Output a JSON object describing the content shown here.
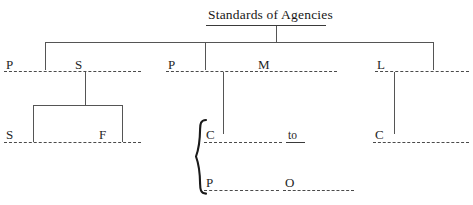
{
  "diagram": {
    "title": "Standards of Agencies",
    "type": "fill-in-the-blank organizational tree",
    "level2": [
      {
        "id": "p1",
        "label": "P"
      },
      {
        "id": "s1",
        "label": "S"
      },
      {
        "id": "p2",
        "label": "P"
      },
      {
        "id": "m1",
        "label": "M"
      },
      {
        "id": "l1",
        "label": "L"
      }
    ],
    "level3_left": [
      {
        "id": "s2",
        "label": "S"
      },
      {
        "id": "f1",
        "label": "F"
      }
    ],
    "level3_center": [
      {
        "id": "c1",
        "label": "C"
      },
      {
        "id": "to",
        "label": "to"
      },
      {
        "id": "p3",
        "label": "P"
      },
      {
        "id": "o1",
        "label": "O"
      }
    ],
    "level3_right": [
      {
        "id": "c2",
        "label": "C"
      }
    ],
    "brace_glyph": "{",
    "colors": {
      "text": "#1f1f1f",
      "rule": "#4a4a4a",
      "connector": "#555555",
      "background": "#ffffff"
    }
  }
}
